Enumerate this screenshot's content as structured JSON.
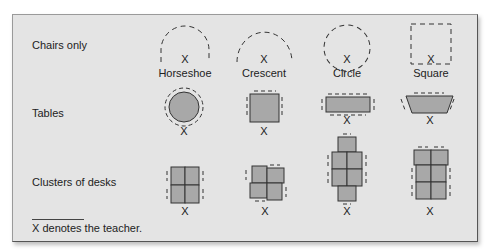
{
  "rows": [
    {
      "label": "Chairs only"
    },
    {
      "label": "Tables"
    },
    {
      "label": "Clusters of desks"
    }
  ],
  "chairs_only": [
    {
      "caption": "Horseshoe",
      "teacher": "X"
    },
    {
      "caption": "Crescent",
      "teacher": "X"
    },
    {
      "caption": "Circle",
      "teacher": "X"
    },
    {
      "caption": "Square",
      "teacher": "X"
    }
  ],
  "tables": [
    {
      "shape": "circle",
      "teacher": "X"
    },
    {
      "shape": "square",
      "teacher": "X"
    },
    {
      "shape": "rectangle",
      "teacher": "X"
    },
    {
      "shape": "trapezoid",
      "teacher": "X"
    }
  ],
  "clusters": [
    {
      "shape": "2x2 grid",
      "teacher": "X"
    },
    {
      "shape": "offset pinwheel",
      "teacher": "X"
    },
    {
      "shape": "cross (2x2 with end desks)",
      "teacher": "X"
    },
    {
      "shape": "2x3 grid",
      "teacher": "X"
    }
  ],
  "footnote": "X denotes the teacher.",
  "colors": {
    "panel": "#e4e4e4",
    "fill": "#a8a8a8",
    "stroke": "#333333"
  }
}
